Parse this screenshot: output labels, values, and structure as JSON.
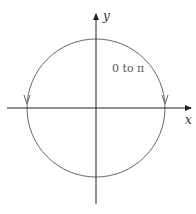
{
  "diagram": {
    "title": "",
    "axes": {
      "x_label": "x",
      "y_label": "y"
    },
    "curve": {
      "shape": "circle",
      "label": "0 to π",
      "direction": "clockwise from top toward the x-axis on both sides"
    },
    "colors": {
      "axis": "#222222",
      "curve": "#666666",
      "background": "#ffffff"
    }
  }
}
